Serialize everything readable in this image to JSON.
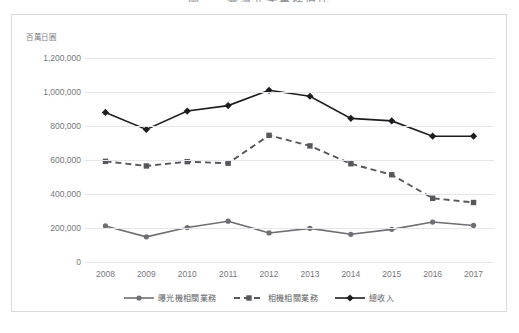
{
  "title": "圖一　臺灣光學業務佔比",
  "axis_unit_label": "百萬日圓",
  "frame": {
    "border_color": "#d9d9dd",
    "background": "#ffffff"
  },
  "legend": {
    "position": "bottom-center",
    "items": [
      {
        "label": "曝光機相關業務",
        "color": "#6e6e73",
        "marker": "circle",
        "dash": "solid"
      },
      {
        "label": "相機相關業務",
        "color": "#58585c",
        "marker": "square",
        "dash": "dashed"
      },
      {
        "label": "總收入",
        "color": "#1d1d1f",
        "marker": "diamond",
        "dash": "solid"
      }
    ]
  },
  "chart_data": {
    "type": "line",
    "title": "圖一　臺灣光學業務佔比",
    "xlabel": "",
    "ylabel": "百萬日圓",
    "ylim": [
      0,
      1200000
    ],
    "ytick_step": 200000,
    "ytick_labels": [
      "1,200,000",
      "1,000,000",
      "800,000",
      "600,000",
      "400,000",
      "200,000",
      "0"
    ],
    "ytick_values": [
      1200000,
      1000000,
      800000,
      600000,
      400000,
      200000,
      0
    ],
    "grid": true,
    "categories": [
      "2008",
      "2009",
      "2010",
      "2011",
      "2012",
      "2013",
      "2014",
      "2015",
      "2016",
      "2017"
    ],
    "x": [
      2008,
      2009,
      2010,
      2011,
      2012,
      2013,
      2014,
      2015,
      2016,
      2017
    ],
    "series": [
      {
        "name": "曝光機相關業務",
        "color": "#6e6e73",
        "marker": "circle",
        "dash": "solid",
        "values": [
          212000,
          148000,
          203000,
          240000,
          171000,
          198000,
          163000,
          192000,
          235000,
          215000
        ]
      },
      {
        "name": "相機相關業務",
        "color": "#58585c",
        "marker": "square",
        "dash": "dashed",
        "values": [
          592000,
          565000,
          590000,
          581000,
          745000,
          683000,
          578000,
          513000,
          375000,
          350000
        ]
      },
      {
        "name": "總收入",
        "color": "#1d1d1f",
        "marker": "diamond",
        "dash": "solid",
        "values": [
          880000,
          780000,
          888000,
          920000,
          1010000,
          975000,
          845000,
          830000,
          740000,
          740000
        ]
      }
    ]
  }
}
